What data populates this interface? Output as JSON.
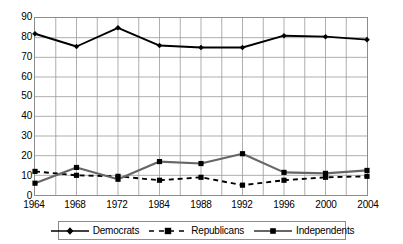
{
  "chart_data": {
    "type": "line",
    "title": "",
    "subtitle": "",
    "xlabel": "",
    "ylabel": "",
    "xlim": [
      1964,
      2004
    ],
    "ylim": [
      0,
      90
    ],
    "yticks": [
      0,
      10,
      20,
      30,
      40,
      50,
      60,
      70,
      80,
      90
    ],
    "xticks": [
      1964,
      1968,
      1972,
      1984,
      1988,
      1992,
      1996,
      2000,
      2004
    ],
    "x": [
      1964,
      1968,
      1972,
      1984,
      1988,
      1992,
      1996,
      2000,
      2004
    ],
    "grid": "both",
    "legend_position": "bottom",
    "series": [
      {
        "name": "Democrats",
        "color": "#000000",
        "style": "solid",
        "marker": "diamond",
        "values": [
          82,
          75.5,
          85,
          76,
          75,
          75,
          81,
          80.5,
          79
        ]
      },
      {
        "name": "Republicans",
        "color": "#000000",
        "style": "dashed",
        "marker": "square",
        "values": [
          12,
          10,
          9.5,
          7.5,
          9,
          5,
          7.5,
          9,
          9.5
        ]
      },
      {
        "name": "Independents",
        "color": "#666666",
        "style": "solid",
        "marker": "square",
        "values": [
          6,
          14,
          8,
          17,
          16,
          21,
          11.5,
          11,
          12.5
        ]
      }
    ]
  },
  "axes": {
    "y_tick_labels": [
      "90",
      "80",
      "70",
      "60",
      "50",
      "40",
      "30",
      "20",
      "10",
      "0"
    ],
    "x_tick_labels": [
      "1964",
      "1968",
      "1972",
      "1984",
      "1988",
      "1992",
      "1996",
      "2000",
      "2004"
    ]
  },
  "legend": {
    "items": [
      {
        "label": "Democrats",
        "color": "#000000",
        "style": "solid",
        "marker": "diamond"
      },
      {
        "label": "Republicans",
        "color": "#000000",
        "style": "dashed",
        "marker": "square"
      },
      {
        "label": "Independents",
        "color": "#666666",
        "style": "solid",
        "marker": "square"
      }
    ]
  },
  "colors": {
    "grid": "#9a9a9a",
    "frame": "#8c8c8c",
    "background": "#ffffff",
    "democrats": "#000000",
    "republicans": "#000000",
    "independents": "#666666"
  }
}
